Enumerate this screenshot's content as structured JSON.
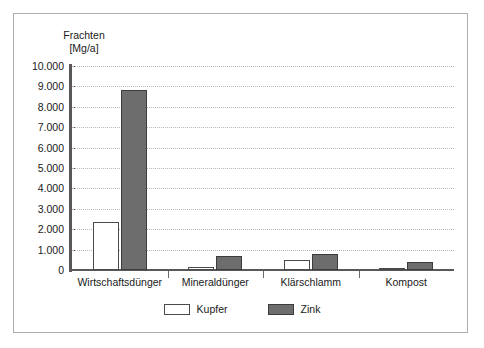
{
  "chart_data": {
    "type": "bar",
    "title": "",
    "subtitle": "",
    "ylabel": "Frachten\n[Mg/a]",
    "xlabel": "",
    "categories": [
      "Wirtschaftsdünger",
      "Mineraldünger",
      "Klärschlamm",
      "Kompost"
    ],
    "series": [
      {
        "name": "Kupfer",
        "color": "#ffffff",
        "values": [
          2350,
          150,
          490,
          110
        ]
      },
      {
        "name": "Zink",
        "color": "#6d6d6d",
        "values": [
          8820,
          690,
          780,
          400
        ]
      }
    ],
    "ylim": [
      0,
      10000
    ],
    "ytick_values": [
      0,
      1000,
      2000,
      3000,
      4000,
      5000,
      6000,
      7000,
      8000,
      9000,
      10000
    ],
    "ytick_labels": [
      "0",
      "1.000",
      "2.000",
      "3.000",
      "4.000",
      "5.000",
      "6.000",
      "7.000",
      "8.000",
      "9.000",
      "10.000"
    ],
    "grid": true,
    "grid_style": "dotted-horizontal",
    "legend_position": "bottom-center",
    "legend_entries": [
      "Kupfer",
      "Zink"
    ],
    "annotations": [],
    "frame_color": "#aeaeae",
    "axis_color": "#585858",
    "gridline_color": "#b9b9b9",
    "text_color": "#1a1a1a",
    "background": "#ffffff"
  }
}
